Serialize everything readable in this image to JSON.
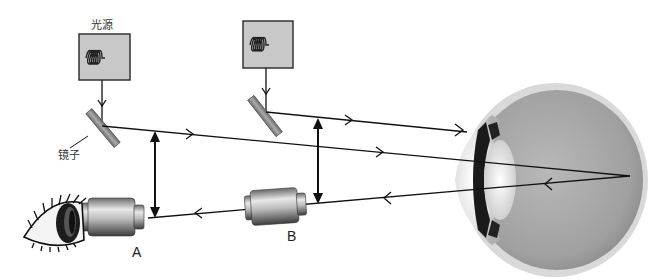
{
  "diagram": {
    "type": "optical-schematic",
    "labels": {
      "light_source": "光源",
      "mirror": "镜子",
      "device_a": "A",
      "device_b": "B"
    },
    "components": [
      {
        "id": "light-source-1",
        "kind": "light-source-box",
        "label_key": "light_source"
      },
      {
        "id": "light-source-2",
        "kind": "light-source-box"
      },
      {
        "id": "mirror-1",
        "kind": "mirror",
        "label_key": "mirror"
      },
      {
        "id": "mirror-2",
        "kind": "mirror"
      },
      {
        "id": "device-a",
        "kind": "lens-cylinder",
        "label_key": "device_a"
      },
      {
        "id": "device-b",
        "kind": "lens-cylinder",
        "label_key": "device_b"
      },
      {
        "id": "observer-eye",
        "kind": "external-eye"
      },
      {
        "id": "eyeball",
        "kind": "eyeball-cross-section"
      }
    ],
    "colors": {
      "line": "#111111",
      "box_fill": "#c8c8c8",
      "box_stroke": "#333333",
      "mirror_fill": "#8a8a8a",
      "eyeball_fill": "#a8a8a8",
      "eyeball_rim": "#d6d6d6"
    }
  }
}
